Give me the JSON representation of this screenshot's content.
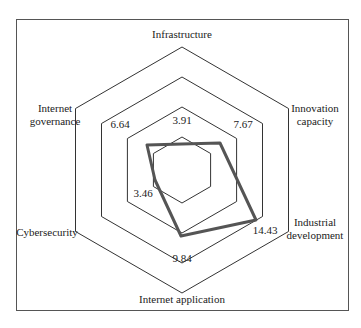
{
  "chart_data": {
    "type": "radar",
    "title": "",
    "axes": [
      {
        "label": "Infrastructure",
        "lines": [
          "Infrastructure"
        ],
        "value": 3.91
      },
      {
        "label": "Innovation capacity",
        "lines": [
          "Innovation",
          "capacity"
        ],
        "value": 7.67
      },
      {
        "label": "Industrial development",
        "lines": [
          "Industrial",
          "development"
        ],
        "value": 14.43
      },
      {
        "label": "Internet application",
        "lines": [
          "Internet application"
        ],
        "value": 9.84
      },
      {
        "label": "Cybersecurity",
        "lines": [
          "Cybersecurity"
        ],
        "value": 3.46
      },
      {
        "label": "Internet governance",
        "lines": [
          "Internet",
          "governance"
        ],
        "value": 6.64
      }
    ],
    "categories": [
      "Infrastructure",
      "Innovation capacity",
      "Industrial development",
      "Internet application",
      "Cybersecurity",
      "Internet governance"
    ],
    "values": [
      3.91,
      7.67,
      14.43,
      9.84,
      3.46,
      6.64
    ],
    "grid_rings": 4,
    "grid_shape": "hexagon",
    "legend": "none",
    "colors": {
      "series": "#555555",
      "grid": "#333333",
      "frame": "#444444"
    }
  },
  "value_labels": [
    "3.91",
    "7.67",
    "14.43",
    "9.84",
    "3.46",
    "6.64"
  ]
}
